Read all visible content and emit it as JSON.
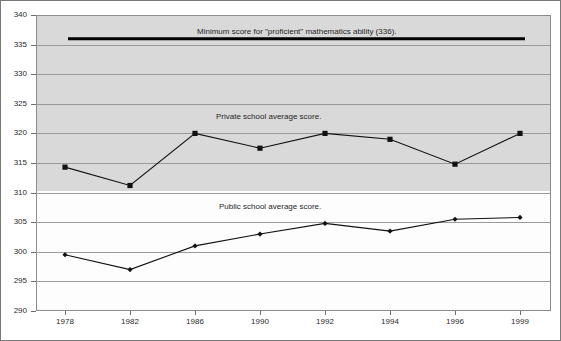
{
  "chart_data": {
    "type": "line",
    "title": "",
    "xlabel": "",
    "ylabel": "",
    "categories": [
      "1978",
      "1982",
      "1986",
      "1990",
      "1992",
      "1994",
      "1996",
      "1999"
    ],
    "ylim": [
      290,
      340
    ],
    "yticks": [
      290,
      295,
      300,
      305,
      310,
      315,
      320,
      325,
      330,
      335,
      340
    ],
    "grid": true,
    "legend_position": "inline-annotations",
    "series": [
      {
        "name": "Private school average score.",
        "marker": "square",
        "color": "#111111",
        "values": [
          314.3,
          311.2,
          320.0,
          317.5,
          320.0,
          319.0,
          314.8,
          320.0
        ]
      },
      {
        "name": "Public school average score.",
        "marker": "diamond",
        "color": "#111111",
        "values": [
          299.5,
          297.0,
          301.0,
          303.0,
          304.8,
          303.5,
          305.5,
          305.8
        ]
      }
    ],
    "reference_line": {
      "label": "Minimum score for \"proficient\" mathematics ability (336).",
      "value": 336,
      "color": "#000000"
    },
    "annotations": [
      {
        "text": "Minimum score for \"proficient\" mathematics ability (336).",
        "value": 336
      },
      {
        "text": "Private school average score.",
        "value": 322
      },
      {
        "text": "Public school average score.",
        "value": 307
      }
    ],
    "ytick_labels": [
      "340",
      "335",
      "330",
      "325",
      "320",
      "315",
      "310",
      "305",
      "300",
      "295",
      "290"
    ],
    "xtick_labels": [
      "1978",
      "1982",
      "1986",
      "1990",
      "1992",
      "1994",
      "1996",
      "1999"
    ]
  }
}
